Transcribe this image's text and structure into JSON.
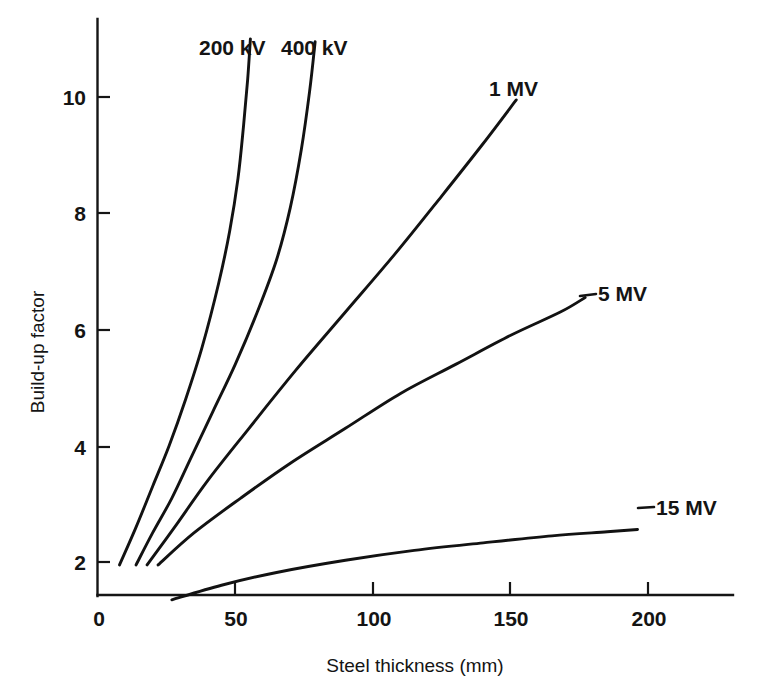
{
  "chart_data": {
    "type": "line",
    "title": "",
    "xlabel": "Steel thickness (mm)",
    "ylabel": "Build-up factor",
    "xlim": [
      0,
      230
    ],
    "ylim": [
      0,
      11.2
    ],
    "xticks": [
      0,
      50,
      100,
      150,
      200
    ],
    "xtick_labels": [
      "0",
      "50",
      "100",
      "150",
      "200"
    ],
    "yticks": [
      2,
      4,
      6,
      8,
      10
    ],
    "ytick_labels": [
      "2",
      "4",
      "6",
      "8",
      "10"
    ],
    "grid": false,
    "legend_position": "inline-end-labels",
    "series": [
      {
        "name": "200 kV",
        "label": "200 kV",
        "points": [
          [
            8,
            1.95
          ],
          [
            14,
            2.6
          ],
          [
            20,
            3.3
          ],
          [
            26,
            4.0
          ],
          [
            32,
            4.8
          ],
          [
            38,
            5.7
          ],
          [
            44,
            6.8
          ],
          [
            48,
            7.7
          ],
          [
            51,
            8.6
          ],
          [
            53,
            9.5
          ],
          [
            54.5,
            10.3
          ],
          [
            55.5,
            11.0
          ]
        ]
      },
      {
        "name": "400 kV",
        "label": "400 kV",
        "points": [
          [
            14,
            1.95
          ],
          [
            20,
            2.5
          ],
          [
            27,
            3.1
          ],
          [
            34,
            3.8
          ],
          [
            42,
            4.6
          ],
          [
            50,
            5.4
          ],
          [
            58,
            6.3
          ],
          [
            65,
            7.2
          ],
          [
            70,
            8.1
          ],
          [
            74,
            9.1
          ],
          [
            77,
            10.1
          ],
          [
            79,
            10.95
          ]
        ]
      },
      {
        "name": "1 MV",
        "label": "1 MV",
        "points": [
          [
            18,
            1.95
          ],
          [
            28,
            2.6
          ],
          [
            40,
            3.4
          ],
          [
            55,
            4.3
          ],
          [
            72,
            5.3
          ],
          [
            90,
            6.3
          ],
          [
            108,
            7.3
          ],
          [
            125,
            8.3
          ],
          [
            140,
            9.2
          ],
          [
            152,
            9.95
          ]
        ]
      },
      {
        "name": "5 MV",
        "label": "5 MV",
        "points": [
          [
            22,
            1.95
          ],
          [
            35,
            2.5
          ],
          [
            52,
            3.1
          ],
          [
            70,
            3.7
          ],
          [
            90,
            4.3
          ],
          [
            110,
            4.9
          ],
          [
            130,
            5.4
          ],
          [
            150,
            5.9
          ],
          [
            168,
            6.3
          ],
          [
            177,
            6.55
          ]
        ]
      },
      {
        "name": "15 MV",
        "label": "15 MV",
        "points": [
          [
            27,
            1.35
          ],
          [
            45,
            1.6
          ],
          [
            65,
            1.82
          ],
          [
            90,
            2.03
          ],
          [
            115,
            2.2
          ],
          [
            140,
            2.33
          ],
          [
            165,
            2.45
          ],
          [
            185,
            2.52
          ],
          [
            196,
            2.56
          ]
        ]
      }
    ]
  },
  "labels": {
    "series_200kv": "200 kV",
    "series_400kv": "400 kV",
    "series_1mv": "1 MV",
    "series_5mv": "5 MV",
    "series_15mv": "15 MV",
    "x_axis_title": "Steel thickness (mm)",
    "y_axis_title": "Build-up factor",
    "x_tick_0": "0",
    "x_tick_50": "50",
    "x_tick_100": "100",
    "x_tick_150": "150",
    "x_tick_200": "200",
    "y_tick_2": "2",
    "y_tick_4": "4",
    "y_tick_6": "6",
    "y_tick_8": "8",
    "y_tick_10": "10"
  },
  "colors": {
    "curve": "#121212",
    "axis": "#151515",
    "background": "#ffffff",
    "text": "#141414"
  }
}
